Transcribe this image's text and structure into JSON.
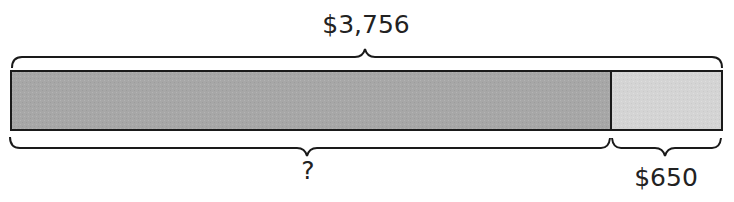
{
  "diagram": {
    "type": "bar_model",
    "total_label": "$3,756",
    "unknown_label": "?",
    "known_part_label": "$650",
    "colors": {
      "unknown_part_fill": "#a9a9a9",
      "known_part_fill": "#d6d6d6",
      "outline": "#1a1a1a"
    }
  }
}
